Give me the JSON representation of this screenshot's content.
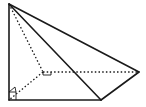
{
  "diagram": {
    "type": "3d-pyramid",
    "colors": {
      "line": "#1a1a1a",
      "background": "#ffffff"
    },
    "vertices": {
      "apex": [
        9,
        4
      ],
      "base_left": [
        9,
        100
      ],
      "base_front": [
        101,
        100
      ],
      "base_right": [
        139,
        72
      ],
      "hidden_back": [
        43,
        72
      ]
    },
    "solid_edges": [
      [
        "apex",
        "base_left"
      ],
      [
        "base_left",
        "base_front"
      ],
      [
        "base_front",
        "base_right"
      ],
      [
        "apex",
        "base_front"
      ],
      [
        "apex",
        "base_right"
      ]
    ],
    "hidden_edges": [
      [
        "apex",
        "hidden_back"
      ],
      [
        "hidden_back",
        "base_right"
      ],
      [
        "hidden_back",
        "base_left"
      ]
    ],
    "right_angle_markers": [
      "base_left",
      "hidden_back"
    ],
    "labels": []
  }
}
